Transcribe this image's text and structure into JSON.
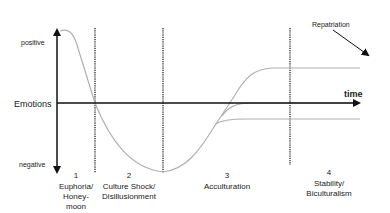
{
  "diagram": {
    "y_axis": {
      "label": "Emotions",
      "top_label": "positive",
      "bottom_label": "negative"
    },
    "x_axis": {
      "label": "time"
    },
    "annotation": {
      "label": "Repatriation"
    },
    "phases": [
      {
        "number": "1",
        "line1": "Euphoria/",
        "line2": "Honey-",
        "line3": "moon"
      },
      {
        "number": "2",
        "line1": "Culture Shock/",
        "line2": "Disillusionment",
        "line3": ""
      },
      {
        "number": "3",
        "line1": "Acculturation",
        "line2": "",
        "line3": ""
      },
      {
        "number": "4",
        "line1": "Stability/",
        "line2": "Biculturalism",
        "line3": ""
      }
    ],
    "outcomes": [
      {
        "name": "upper",
        "level": "above baseline"
      },
      {
        "name": "middle",
        "level": "baseline"
      },
      {
        "name": "lower",
        "level": "below baseline"
      }
    ],
    "colors": {
      "axis": "#111111",
      "curve": "#b0b0b0",
      "divider": "#333333",
      "text": "#222222"
    }
  }
}
